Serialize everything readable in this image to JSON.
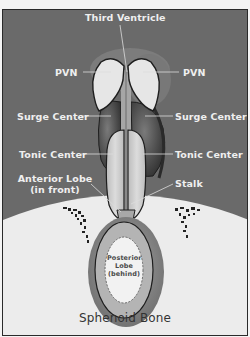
{
  "diagram": {
    "type": "anatomical-cross-section",
    "labels": {
      "third_ventricle": "Third Ventricle",
      "pvn_left": "PVN",
      "pvn_right": "PVN",
      "surge_left": "Surge Center",
      "surge_right": "Surge Center",
      "tonic_left": "Tonic Center",
      "tonic_right": "Tonic Center",
      "anterior_line1": "Anterior Lobe",
      "anterior_line2": "(in front)",
      "stalk": "Stalk",
      "posterior_line1": "Posterior",
      "posterior_line2": "Lobe",
      "posterior_line3": "(behind)",
      "sphenoid": "Sphenoid Bone"
    },
    "colors": {
      "background_brain": "#6a6a6a",
      "bone": "#ececec",
      "pvn_fill": "#e6e6e6",
      "surge_fill": "#4a4a4a",
      "tonic_fill": "#d2d2d2",
      "pituitary_outer": "#8e8e8e",
      "pituitary_inner": "#b4b4b4",
      "posterior_lobe": "#f2f2f2",
      "outline": "#1e1e1e"
    }
  }
}
